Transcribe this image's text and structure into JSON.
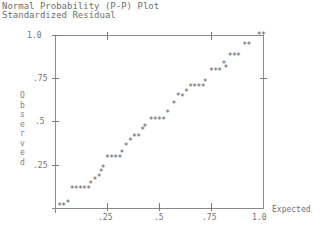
{
  "chart_data": {
    "type": "scatter",
    "title": "Normal Probability (P-P) Plot",
    "subtitle": "Standardized Residual",
    "xlabel": "Expected",
    "ylabel": "Observed",
    "xlim": [
      0,
      1.0
    ],
    "ylim": [
      0,
      1.0
    ],
    "x_ticks": [
      ".25",
      ".5",
      ".75",
      "1.0"
    ],
    "y_ticks": [
      "1.0",
      ".75",
      ".5",
      ".25"
    ],
    "grid": false,
    "marker": "*",
    "points": [
      [
        0.02,
        0.01
      ],
      [
        0.04,
        0.01
      ],
      [
        0.06,
        0.03
      ],
      [
        0.08,
        0.11
      ],
      [
        0.1,
        0.11
      ],
      [
        0.12,
        0.11
      ],
      [
        0.14,
        0.11
      ],
      [
        0.16,
        0.11
      ],
      [
        0.17,
        0.14
      ],
      [
        0.19,
        0.16
      ],
      [
        0.21,
        0.18
      ],
      [
        0.22,
        0.21
      ],
      [
        0.23,
        0.23
      ],
      [
        0.25,
        0.29
      ],
      [
        0.27,
        0.29
      ],
      [
        0.29,
        0.29
      ],
      [
        0.31,
        0.29
      ],
      [
        0.32,
        0.32
      ],
      [
        0.34,
        0.36
      ],
      [
        0.36,
        0.39
      ],
      [
        0.38,
        0.41
      ],
      [
        0.4,
        0.41
      ],
      [
        0.42,
        0.45
      ],
      [
        0.43,
        0.47
      ],
      [
        0.46,
        0.51
      ],
      [
        0.48,
        0.51
      ],
      [
        0.5,
        0.51
      ],
      [
        0.52,
        0.51
      ],
      [
        0.54,
        0.55
      ],
      [
        0.57,
        0.6
      ],
      [
        0.59,
        0.65
      ],
      [
        0.61,
        0.64
      ],
      [
        0.63,
        0.67
      ],
      [
        0.65,
        0.7
      ],
      [
        0.67,
        0.7
      ],
      [
        0.69,
        0.7
      ],
      [
        0.71,
        0.7
      ],
      [
        0.72,
        0.73
      ],
      [
        0.75,
        0.79
      ],
      [
        0.77,
        0.79
      ],
      [
        0.79,
        0.79
      ],
      [
        0.81,
        0.83
      ],
      [
        0.82,
        0.81
      ],
      [
        0.84,
        0.88
      ],
      [
        0.86,
        0.88
      ],
      [
        0.88,
        0.88
      ],
      [
        0.91,
        0.94
      ],
      [
        0.93,
        0.94
      ],
      [
        0.98,
        1.0
      ],
      [
        1.0,
        1.0
      ]
    ]
  }
}
